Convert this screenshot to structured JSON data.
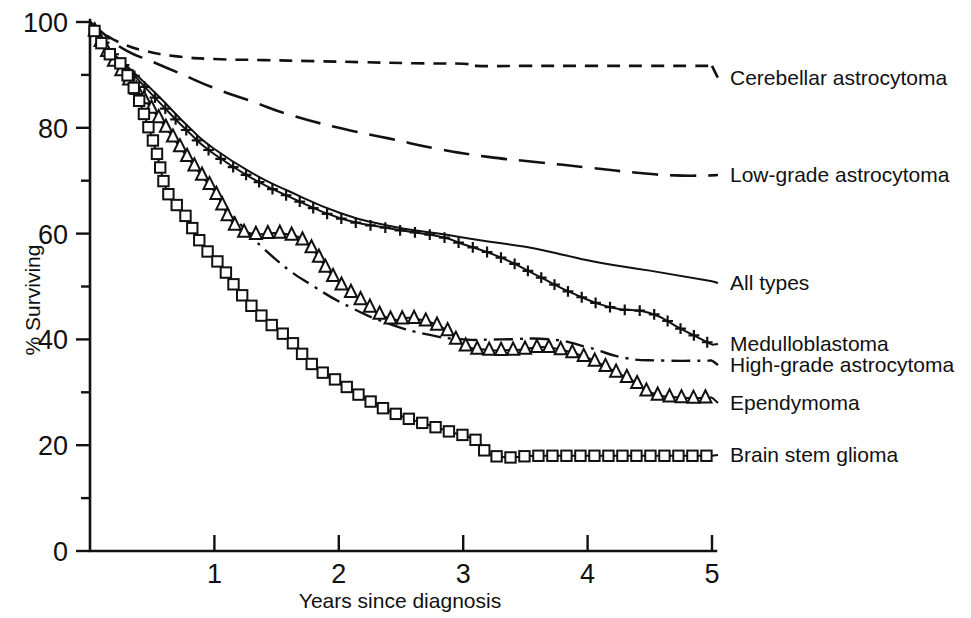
{
  "chart_data": {
    "type": "line",
    "title": "",
    "xlabel": "Years since diagnosis",
    "ylabel": "% Surviving",
    "xlim": [
      0,
      5
    ],
    "ylim": [
      0,
      100
    ],
    "grid": false,
    "legend_position": "right-inline-at-curve-end",
    "x_ticks": [
      "1",
      "2",
      "3",
      "4",
      "5"
    ],
    "x_tick_values": [
      1,
      2,
      3,
      4,
      5
    ],
    "y_ticks": [
      "0",
      "20",
      "40",
      "60",
      "80",
      "100"
    ],
    "y_tick_values": [
      0,
      20,
      40,
      60,
      80,
      100
    ],
    "y_minor_tick_values": [
      10,
      30,
      50,
      70,
      90
    ],
    "series": [
      {
        "name": "Cerebellar astrocytoma",
        "style": "dashed",
        "marker": "none",
        "x": [
          0,
          0.1,
          0.25,
          0.45,
          0.7,
          1.0,
          1.4,
          1.8,
          2.2,
          2.6,
          3.0,
          3.1,
          3.5,
          4.0,
          4.5,
          5.0
        ],
        "y": [
          100,
          98,
          96,
          94.5,
          93.5,
          93,
          92.8,
          92.6,
          92.4,
          92.2,
          92.1,
          91.7,
          91.7,
          91.7,
          91.7,
          91.7
        ]
      },
      {
        "name": "Low-grade astrocytoma",
        "style": "long-dash",
        "marker": "none",
        "x": [
          0,
          0.15,
          0.3,
          0.5,
          0.75,
          1.0,
          1.3,
          1.6,
          2.0,
          2.4,
          2.8,
          3.2,
          3.6,
          4.0,
          4.4,
          4.7,
          5.0
        ],
        "y": [
          100,
          97,
          94.5,
          92.5,
          90,
          87.5,
          85,
          82.5,
          80,
          78,
          76,
          74.5,
          73.5,
          72.5,
          71.5,
          71,
          71
        ]
      },
      {
        "name": "All types",
        "style": "solid",
        "marker": "none",
        "x": [
          0,
          0.15,
          0.35,
          0.55,
          0.8,
          1.0,
          1.3,
          1.6,
          2.0,
          2.4,
          2.8,
          3.2,
          3.5,
          3.8,
          4.1,
          4.5,
          5.0
        ],
        "y": [
          100,
          95,
          90.5,
          86,
          80,
          76,
          71.5,
          68,
          64,
          61.5,
          60,
          58.5,
          57.5,
          56,
          54.5,
          53,
          51
        ]
      },
      {
        "name": "Medulloblastoma",
        "style": "solid",
        "marker": "plus",
        "x": [
          0,
          0.15,
          0.35,
          0.55,
          0.8,
          1.0,
          1.3,
          1.6,
          2.0,
          2.4,
          2.8,
          3.0,
          3.3,
          3.6,
          3.9,
          4.2,
          4.5,
          4.75,
          5.0
        ],
        "y": [
          100,
          95,
          90,
          85,
          79,
          75,
          70.5,
          67,
          63,
          61,
          59.5,
          58,
          55.5,
          52,
          48.5,
          46,
          45,
          42,
          39
        ]
      },
      {
        "name": "High-grade astrocytoma",
        "style": "dash-dot",
        "marker": "none",
        "x": [
          0,
          0.15,
          0.35,
          0.55,
          0.8,
          1.0,
          1.2,
          1.5,
          1.8,
          2.1,
          2.4,
          2.7,
          3.0,
          3.3,
          3.7,
          4.0,
          4.3,
          4.6,
          5.0
        ],
        "y": [
          100,
          94,
          88,
          82,
          74,
          68,
          62,
          55,
          50,
          46,
          43,
          41,
          40,
          40,
          40,
          38.5,
          36.5,
          36,
          36
        ]
      },
      {
        "name": "Ependymoma",
        "style": "solid",
        "marker": "triangle",
        "x": [
          0,
          0.15,
          0.35,
          0.55,
          0.8,
          1.0,
          1.15,
          1.3,
          1.55,
          1.75,
          1.95,
          2.15,
          2.4,
          2.6,
          2.85,
          3.0,
          3.2,
          3.4,
          3.8,
          4.3,
          4.5,
          4.75,
          5.0
        ],
        "y": [
          100,
          94,
          88,
          82,
          74,
          68,
          62,
          60,
          60,
          58,
          52,
          48,
          44,
          44,
          42,
          39,
          38,
          38,
          38,
          33,
          30,
          29,
          29
        ]
      },
      {
        "name": "Brain stem glioma",
        "style": "solid",
        "marker": "square",
        "x": [
          0,
          0.12,
          0.3,
          0.5,
          0.62,
          0.75,
          0.9,
          1.05,
          1.2,
          1.4,
          1.6,
          1.8,
          2.0,
          2.2,
          2.45,
          2.7,
          2.9,
          3.1,
          3.25,
          3.6,
          4.0,
          4.5,
          5.0
        ],
        "y": [
          100,
          95,
          90,
          78,
          68,
          64,
          58,
          54,
          49,
          44,
          40,
          35,
          32,
          29,
          26,
          24,
          22.5,
          21,
          18,
          18,
          18,
          18,
          18
        ]
      }
    ]
  },
  "legend": [
    {
      "label": "Cerebellar astrocytoma",
      "x": 730,
      "y": 85
    },
    {
      "label": "Low-grade astrocytoma",
      "x": 730,
      "y": 182
    },
    {
      "label": "All types",
      "x": 730,
      "y": 290
    },
    {
      "label": "Medulloblastoma",
      "x": 730,
      "y": 351
    },
    {
      "label": "High-grade astrocytoma",
      "x": 730,
      "y": 372
    },
    {
      "label": "Ependymoma",
      "x": 730,
      "y": 410
    },
    {
      "label": "Brain stem glioma",
      "x": 730,
      "y": 462
    }
  ]
}
